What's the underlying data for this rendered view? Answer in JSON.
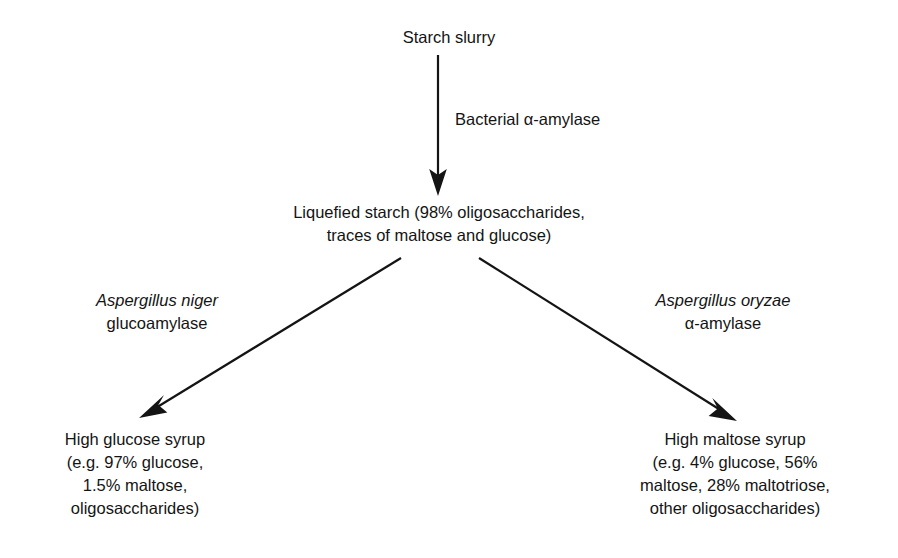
{
  "figure": {
    "type": "flow-diagram",
    "title_visible": false,
    "background_color": "#ffffff",
    "ink_color": "#141414"
  },
  "nodes": {
    "starch_slurry": {
      "lines": [
        "Starch slurry"
      ]
    },
    "liquefied_starch": {
      "lines": [
        "Liquefied starch (98% oligosaccharides,",
        "traces of maltose and glucose)"
      ]
    },
    "high_glucose_syrup": {
      "lines": [
        "High glucose syrup",
        "(e.g. 97% glucose,",
        "1.5% maltose,",
        "oligosaccharides)"
      ]
    },
    "high_maltose_syrup": {
      "lines": [
        "High maltose syrup",
        "(e.g. 4% glucose, 56%",
        "maltose, 28% maltotriose,",
        "other oligosaccharides)"
      ]
    }
  },
  "edge_labels": {
    "bacterial_amylase": {
      "lines": [
        "Bacterial α-amylase"
      ]
    },
    "aspergillus_niger": {
      "lines": [
        "Aspergillus niger",
        "glucoamylase"
      ],
      "italic_lines": [
        0
      ]
    },
    "aspergillus_oryzae": {
      "lines": [
        "Aspergillus oryzae",
        "α-amylase"
      ],
      "italic_lines": [
        0
      ]
    }
  },
  "arrows": [
    {
      "name": "arrow-starch-to-liquefied",
      "from": [
        438,
        55
      ],
      "to": [
        438,
        194
      ],
      "direction": "down"
    },
    {
      "name": "arrow-liquefied-to-glucose",
      "from": [
        401,
        258
      ],
      "to": [
        141,
        417
      ],
      "direction": "down-left"
    },
    {
      "name": "arrow-liquefied-to-maltose",
      "from": [
        479,
        258
      ],
      "to": [
        736,
        420
      ],
      "direction": "down-right"
    }
  ]
}
